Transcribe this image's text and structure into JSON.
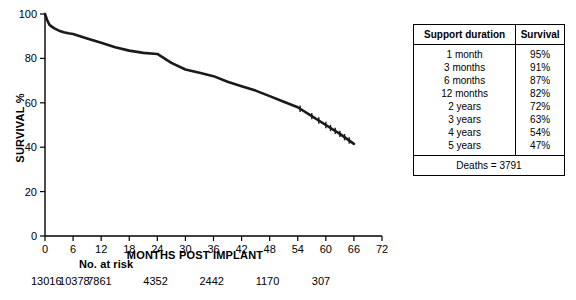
{
  "chart_data": {
    "type": "line",
    "title": "",
    "xlabel": "MONTHS POST IMPLANT",
    "ylabel": "SURVIVAL %",
    "xlim": [
      0,
      72
    ],
    "ylim": [
      0,
      100
    ],
    "xticks": [
      0,
      6,
      12,
      18,
      24,
      30,
      36,
      42,
      48,
      54,
      60,
      66,
      72
    ],
    "yticks": [
      0,
      20,
      40,
      60,
      80,
      100
    ],
    "grid": false,
    "legend": "none",
    "series": [
      {
        "name": "Kaplan-Meier survival",
        "x": [
          0,
          0.5,
          1,
          2,
          3,
          4,
          5,
          6,
          9,
          12,
          15,
          18,
          21,
          24,
          27,
          30,
          33,
          36,
          39,
          42,
          45,
          48,
          51,
          54,
          57,
          60,
          63,
          66
        ],
        "y": [
          100,
          97,
          95,
          93.5,
          92.5,
          91.8,
          91.3,
          91,
          89,
          87,
          85,
          83.5,
          82.5,
          82,
          78,
          75,
          73.5,
          72,
          69.5,
          67.5,
          65.5,
          63,
          60.5,
          58,
          54,
          50,
          46,
          41.5
        ]
      }
    ],
    "censor_marks_x": [
      54.5,
      57,
      58.5,
      60,
      61,
      62,
      63,
      64,
      65
    ]
  },
  "survival_table": {
    "headers": [
      "Support duration",
      "Survival"
    ],
    "rows": [
      {
        "duration": "1 month",
        "survival": "95%"
      },
      {
        "duration": "3 months",
        "survival": "91%"
      },
      {
        "duration": "6 months",
        "survival": "87%"
      },
      {
        "duration": "12 months",
        "survival": "82%"
      },
      {
        "duration": "2 years",
        "survival": "72%"
      },
      {
        "duration": "3 years",
        "survival": "63%"
      },
      {
        "duration": "4 years",
        "survival": "54%"
      },
      {
        "duration": "5 years",
        "survival": "47%"
      }
    ],
    "footer": "Deaths = 3791"
  },
  "risk_table": {
    "label": "No. at risk",
    "values": [
      "13016",
      "10378",
      "7861",
      "4352",
      "2442",
      "1170",
      "307"
    ],
    "x_positions": [
      0,
      6,
      12,
      24,
      36,
      48,
      60
    ]
  },
  "colors": {
    "line": "#1a1a1a",
    "axis": "#000000",
    "background": "#ffffff"
  }
}
